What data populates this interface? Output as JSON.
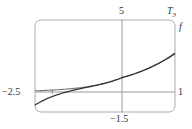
{
  "chart_data": {
    "type": "line",
    "title": "",
    "xlabel": "",
    "ylabel": "",
    "xlim": [
      -2.5,
      1
    ],
    "ylim": [
      -1.5,
      5
    ],
    "grid": false,
    "frame": "rounded-rectangle",
    "tick_labels": {
      "x_left": "−2.5",
      "x_right": "1",
      "y_top": "5",
      "y_bottom": "−1.5"
    },
    "series": [
      {
        "name": "f",
        "label": "f",
        "function": "e^x",
        "color": "#555555"
      },
      {
        "name": "T3",
        "label": "T",
        "label_sub": "3",
        "function": "1 + x + x^2/2 + x^3/6",
        "color": "#333333"
      }
    ]
  },
  "colors": {
    "axis": "#999999",
    "frame": "#aaaaaa",
    "curve_f": "#777777",
    "curve_T3": "#333333"
  },
  "layout_px": {
    "frame": {
      "left": 35,
      "top": 20,
      "right": 175,
      "bottom": 112,
      "radius": 6
    },
    "x_axis_y": 92,
    "y_axis_x": 122
  }
}
